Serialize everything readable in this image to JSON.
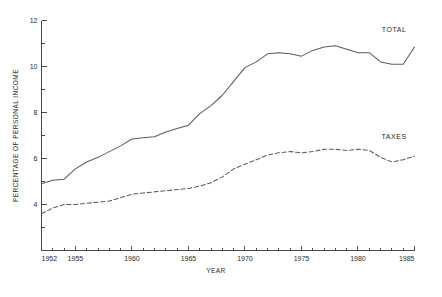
{
  "chart_data": {
    "type": "line",
    "title": "",
    "xlabel": "YEAR",
    "ylabel": "PERCENTAGE OF PERSONAL INCOME",
    "xlim": [
      1952,
      1985
    ],
    "ylim": [
      2,
      12
    ],
    "grid": false,
    "legend_position": "right-inline-labels",
    "x_ticks_major": [
      1952,
      1955,
      1960,
      1965,
      1970,
      1975,
      1980,
      1985
    ],
    "x_tick_labels": [
      "1952",
      "1955",
      "1960",
      "1965",
      "1970",
      "1975",
      "1980",
      "1985"
    ],
    "x_tick_minor_step": 1,
    "y_ticks_major": [
      4,
      6,
      8,
      10,
      12
    ],
    "y_tick_labels": [
      "4",
      "6",
      "8",
      "10",
      "12"
    ],
    "y_tick_minor_step": 1,
    "x": [
      1952,
      1953,
      1954,
      1955,
      1956,
      1957,
      1958,
      1959,
      1960,
      1961,
      1962,
      1963,
      1964,
      1965,
      1966,
      1967,
      1968,
      1969,
      1970,
      1971,
      1972,
      1973,
      1974,
      1975,
      1976,
      1977,
      1978,
      1979,
      1980,
      1981,
      1982,
      1983,
      1984,
      1985
    ],
    "series": [
      {
        "name": "TOTAL",
        "label": "TOTAL",
        "style": "solid",
        "color": "#5c5c5c",
        "label_x": 1983.2,
        "label_y": 11.5,
        "values": [
          4.9,
          5.05,
          5.1,
          5.55,
          5.85,
          6.05,
          6.3,
          6.55,
          6.85,
          6.9,
          6.95,
          7.15,
          7.3,
          7.45,
          7.95,
          8.3,
          8.75,
          9.35,
          9.95,
          10.2,
          10.55,
          10.6,
          10.55,
          10.45,
          10.7,
          10.85,
          10.9,
          10.75,
          10.6,
          10.6,
          10.2,
          10.1,
          10.1,
          10.85
        ]
      },
      {
        "name": "TAXES",
        "label": "TAXES",
        "style": "dashed",
        "color": "#5c5c5c",
        "label_x": 1983.2,
        "label_y": 6.85,
        "values": [
          3.6,
          3.85,
          4.0,
          4.0,
          4.05,
          4.1,
          4.15,
          4.3,
          4.45,
          4.5,
          4.55,
          4.6,
          4.65,
          4.7,
          4.8,
          4.95,
          5.2,
          5.55,
          5.75,
          5.95,
          6.15,
          6.25,
          6.3,
          6.25,
          6.3,
          6.4,
          6.4,
          6.35,
          6.4,
          6.35,
          6.05,
          5.85,
          5.95,
          6.1
        ]
      }
    ]
  },
  "figure": {
    "caption_fragment": ""
  }
}
